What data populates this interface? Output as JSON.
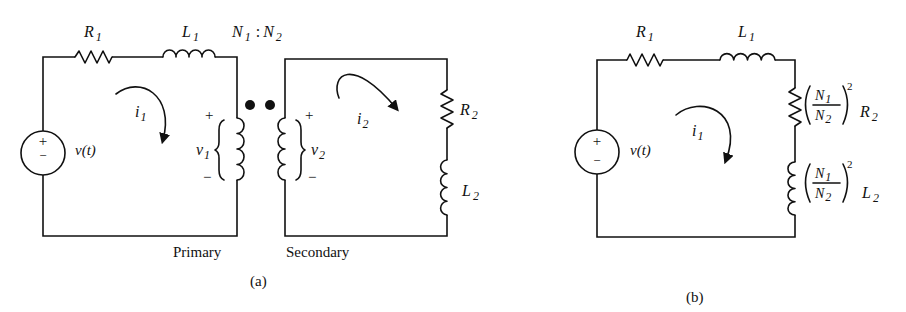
{
  "figure_a": {
    "caption": "(a)",
    "source": {
      "label": "v(t)",
      "plus": "+",
      "minus": "−"
    },
    "r1": {
      "name": "R",
      "sub": "1"
    },
    "l1": {
      "name": "L",
      "sub": "1"
    },
    "turns_ratio": {
      "n1": "N",
      "n1_sub": "1",
      "sep": ":",
      "n2": "N",
      "n2_sub": "2"
    },
    "current_1": {
      "name": "i",
      "sub": "1"
    },
    "current_2": {
      "name": "i",
      "sub": "2"
    },
    "v1": {
      "name": "v",
      "sub": "1",
      "plus": "+",
      "minus": "−"
    },
    "v2": {
      "name": "v",
      "sub": "2",
      "plus": "+",
      "minus": "−"
    },
    "r2": {
      "name": "R",
      "sub": "2"
    },
    "l2": {
      "name": "L",
      "sub": "2"
    },
    "primary_label": "Primary",
    "secondary_label": "Secondary"
  },
  "figure_b": {
    "caption": "(b)",
    "source": {
      "label": "v(t)",
      "plus": "+",
      "minus": "−"
    },
    "r1": {
      "name": "R",
      "sub": "1"
    },
    "l1": {
      "name": "L",
      "sub": "1"
    },
    "current_1": {
      "name": "i",
      "sub": "1"
    },
    "reflected_r2": {
      "n1": "N",
      "n1_sub": "1",
      "n2": "N",
      "n2_sub": "2",
      "exp": "2",
      "name": "R",
      "sub": "2"
    },
    "reflected_l2": {
      "n1": "N",
      "n1_sub": "1",
      "n2": "N",
      "n2_sub": "2",
      "exp": "2",
      "name": "L",
      "sub": "2"
    }
  }
}
